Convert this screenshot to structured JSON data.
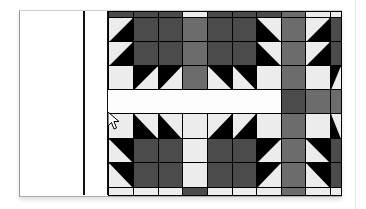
{
  "colors": {
    "dark": "#4b4b4b",
    "medium": "#6c6c6c",
    "light": "#ececec",
    "black": "#000000"
  },
  "quilt": {
    "columns_x": [
      108,
      133,
      158,
      182,
      207,
      232,
      256,
      281,
      305,
      330,
      341
    ],
    "top_block": {
      "strip": [
        "D",
        "D",
        "D",
        "L",
        "D",
        "D",
        "D",
        "M",
        "L",
        "L"
      ],
      "rows": [
        [
          "HST-tl-white",
          "D",
          "D",
          "M",
          "D",
          "D",
          "HST-tr-white",
          "M",
          "HST-tl-white",
          "D"
        ],
        [
          "HST-tl-white",
          "D",
          "D",
          "M",
          "D",
          "D",
          "HST-tr-white",
          "M",
          "HST-tl-white",
          "D"
        ],
        [
          "L",
          "HST-br-white",
          "HST-br-white",
          "M",
          "HST-bl-white",
          "HST-bl-white",
          "L",
          "M",
          "L",
          "HST-br-white"
        ]
      ]
    },
    "sashing_row": [
      "W",
      "W",
      "W",
      "W",
      "W",
      "W",
      "W",
      "D",
      "M",
      "M"
    ],
    "bottom_block": {
      "rows": [
        [
          "L",
          "HST-tr-white",
          "HST-tr-white",
          "L",
          "HST-tl-white",
          "HST-tl-white",
          "L",
          "M",
          "L",
          "HST-tr-white"
        ],
        [
          "HST-bl-white",
          "D",
          "D",
          "L",
          "D",
          "D",
          "HST-br-white",
          "M",
          "HST-bl-white",
          "D"
        ],
        [
          "HST-bl-white",
          "D",
          "D",
          "L",
          "D",
          "D",
          "HST-br-white",
          "M",
          "HST-bl-white",
          "D"
        ]
      ],
      "strip": [
        "L",
        "L",
        "L",
        "D",
        "L",
        "L",
        "L",
        "M",
        "L",
        "L"
      ]
    }
  },
  "cursor": {
    "type": "arrow-pointer",
    "x": 108,
    "y": 113
  }
}
